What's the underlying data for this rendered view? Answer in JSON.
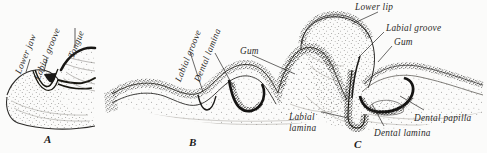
{
  "figure": {
    "caption_letters": [
      "A",
      "B",
      "C"
    ],
    "background_color": "#fbfbfa",
    "ink_color": "#2b2a28",
    "stipple_color": "#3a3835"
  },
  "panels": [
    {
      "id": "A",
      "letter": "A",
      "letter_x": 44,
      "letter_y": 133,
      "labels": [
        {
          "text": "Lower jaw",
          "x": 14,
          "y": 72,
          "rotate": -68
        },
        {
          "text": "Labial groove",
          "x": 33,
          "y": 78,
          "rotate": -68
        },
        {
          "text": "Tongue",
          "x": 67,
          "y": 56,
          "rotate": -68
        }
      ]
    },
    {
      "id": "B",
      "letter": "B",
      "letter_x": 189,
      "letter_y": 136,
      "labels": [
        {
          "text": "Labial groove",
          "x": 174,
          "y": 80,
          "rotate": -68
        },
        {
          "text": "Dental lamina",
          "x": 193,
          "y": 80,
          "rotate": -68
        },
        {
          "text": "Gum",
          "x": 240,
          "y": 47,
          "rotate": 0
        }
      ]
    },
    {
      "id": "C",
      "letter": "C",
      "letter_x": 354,
      "letter_y": 138,
      "labels": [
        {
          "text": "Lower lip",
          "x": 355,
          "y": 3,
          "rotate": 0
        },
        {
          "text": "Labial groove",
          "x": 386,
          "y": 24,
          "rotate": 0
        },
        {
          "text": "Gum",
          "x": 394,
          "y": 38,
          "rotate": 0
        },
        {
          "text": "Labial",
          "x": 289,
          "y": 113,
          "rotate": 0
        },
        {
          "text": "lamina",
          "x": 289,
          "y": 124,
          "rotate": 0
        },
        {
          "text": "Dental lamina",
          "x": 374,
          "y": 129,
          "rotate": 0
        },
        {
          "text": "Dental papilla",
          "x": 414,
          "y": 114,
          "rotate": 0
        }
      ]
    }
  ],
  "label_text": {
    "lower_jaw": "Lower jaw",
    "labial_groove": "Labial groove",
    "tongue": "Tongue",
    "dental_lamina": "Dental lamina",
    "gum": "Gum",
    "lower_lip": "Lower lip",
    "labial": "Labial",
    "lamina": "lamina",
    "dental_papilla": "Dental papilla",
    "letter_a": "A",
    "letter_b": "B",
    "letter_c": "C"
  }
}
